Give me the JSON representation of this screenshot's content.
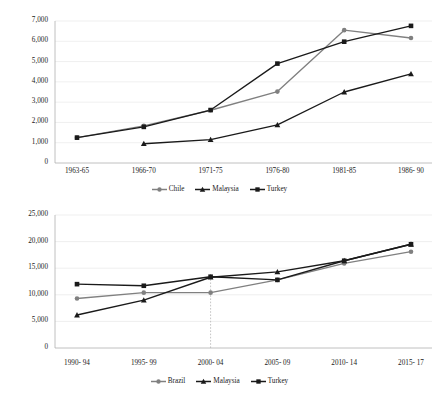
{
  "page": {
    "cropped_header_text": "",
    "background": "#ffffff"
  },
  "colors": {
    "series_gray": "#808080",
    "series_black": "#1a1a1a",
    "gridline": "#e8e8e8",
    "axis": "#b0b0b0",
    "text": "#1a1a1a",
    "reference_line": "#b5b5b5"
  },
  "charts": [
    {
      "id": "chart-top",
      "legend": [
        {
          "label": "Chile",
          "marker": "circle",
          "color": "#808080"
        },
        {
          "label": "Malaysia",
          "marker": "triangle",
          "color": "#1a1a1a"
        },
        {
          "label": "Turkey",
          "marker": "square",
          "color": "#1a1a1a"
        }
      ],
      "y_ticks": [
        "0",
        "1,000",
        "2,000",
        "3,000",
        "4,000",
        "5,000",
        "6,000",
        "7,000"
      ],
      "x_ticks": [
        "1963-65",
        "1966-70",
        "1971-75",
        "1976-80",
        "1981-85",
        "1986- 90"
      ]
    },
    {
      "id": "chart-bottom",
      "legend": [
        {
          "label": "Brazil",
          "marker": "circle",
          "color": "#808080"
        },
        {
          "label": "Malaysia",
          "marker": "triangle",
          "color": "#1a1a1a"
        },
        {
          "label": "Turkey",
          "marker": "square",
          "color": "#1a1a1a"
        }
      ],
      "y_ticks": [
        "0",
        "5,000",
        "10,000",
        "15,000",
        "20,000",
        "25,000"
      ],
      "x_ticks": [
        "1990- 94",
        "1995- 99",
        "2000- 04",
        "2005- 09",
        "2010- 14",
        "2015- 17"
      ]
    }
  ],
  "chart_data": [
    {
      "type": "line",
      "id": "chart-top",
      "title": "",
      "xlabel": "",
      "ylabel": "",
      "categories": [
        "1963-65",
        "1966-70",
        "1971-75",
        "1976-80",
        "1981-85",
        "1986- 90"
      ],
      "ylim": [
        0,
        7000
      ],
      "ytick_step": 1000,
      "grid": true,
      "legend_position": "bottom",
      "series": [
        {
          "name": "Chile",
          "marker": "circle",
          "color": "#808080",
          "values": [
            1250,
            1830,
            2600,
            3520,
            6550,
            6160
          ]
        },
        {
          "name": "Malaysia",
          "marker": "triangle",
          "color": "#1a1a1a",
          "values": [
            null,
            950,
            1150,
            1880,
            3500,
            4390
          ]
        },
        {
          "name": "Turkey",
          "marker": "square",
          "color": "#1a1a1a",
          "values": [
            1250,
            1780,
            2610,
            4900,
            5980,
            6760
          ]
        }
      ]
    },
    {
      "type": "line",
      "id": "chart-bottom",
      "title": "",
      "xlabel": "",
      "ylabel": "",
      "categories": [
        "1990- 94",
        "1995- 99",
        "2000- 04",
        "2005- 09",
        "2010- 14",
        "2015- 17"
      ],
      "ylim": [
        0,
        25000
      ],
      "ytick_step": 5000,
      "grid": true,
      "legend_position": "bottom",
      "annotations": [
        {
          "type": "vertical-reference-line",
          "at_category": "2000- 04",
          "style": "dotted",
          "from_value": 0,
          "to_value": 13400
        }
      ],
      "series": [
        {
          "name": "Brazil",
          "marker": "circle",
          "color": "#808080",
          "values": [
            9300,
            10400,
            10400,
            12800,
            15900,
            18100
          ]
        },
        {
          "name": "Malaysia",
          "marker": "triangle",
          "color": "#1a1a1a",
          "values": [
            6200,
            9000,
            13300,
            14300,
            16400,
            19500
          ]
        },
        {
          "name": "Turkey",
          "marker": "square",
          "color": "#1a1a1a",
          "values": [
            12000,
            11700,
            13400,
            12800,
            16400,
            19500
          ]
        }
      ]
    }
  ]
}
